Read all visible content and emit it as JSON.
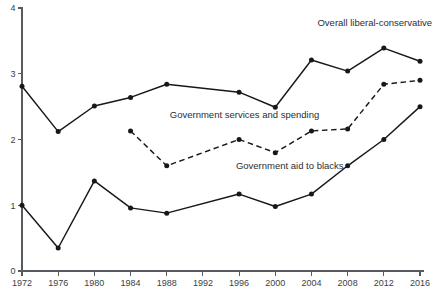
{
  "chart_data": {
    "type": "line",
    "title": "",
    "subtitle": "",
    "xlabel": "",
    "ylabel": "",
    "x": [
      1972,
      1976,
      1980,
      1984,
      1988,
      1992,
      1996,
      2000,
      2004,
      2008,
      2012,
      2016
    ],
    "xtick_labels": [
      "1972",
      "1976",
      "1980",
      "1984",
      "1988",
      "1992",
      "1996",
      "2000",
      "2004",
      "2008",
      "2012",
      "2016"
    ],
    "ytick_labels": [
      "0",
      "1",
      "2",
      "3",
      "4"
    ],
    "ytick_values": [
      0,
      1,
      2,
      3,
      4
    ],
    "xlim": [
      1972,
      2016
    ],
    "ylim": [
      0,
      4
    ],
    "grid": false,
    "legend_position": "inline-annotations",
    "series": [
      {
        "name": "Overall liberal-conservative",
        "style": "solid",
        "marker": "filled-circle",
        "annotation": "Overall liberal-conservative",
        "annotation_x": 2011.0,
        "annotation_y": 3.72,
        "values": [
          2.81,
          2.12,
          2.51,
          2.64,
          2.84,
          null,
          2.72,
          2.49,
          3.21,
          3.04,
          3.39,
          3.19
        ]
      },
      {
        "name": "Government services and spending",
        "style": "dashed",
        "marker": "filled-circle",
        "annotation": "Government services and spending",
        "annotation_x": 1996.6,
        "annotation_y": 2.32,
        "values": [
          null,
          null,
          null,
          2.13,
          1.6,
          null,
          2.0,
          1.8,
          2.13,
          2.16,
          2.84,
          2.9
        ]
      },
      {
        "name": "Government aid to blacks",
        "style": "solid",
        "marker": "filled-circle",
        "annotation": "Government aid to blacks",
        "annotation_x": 2001.6,
        "annotation_y": 1.55,
        "values": [
          1.0,
          0.35,
          1.37,
          0.96,
          0.88,
          null,
          1.17,
          0.98,
          1.17,
          1.6,
          2.0,
          2.5
        ]
      }
    ]
  },
  "colors": {
    "line": "#16181a",
    "axis": "#555b60",
    "text": "#2a2e32",
    "background": "#ffffff"
  }
}
